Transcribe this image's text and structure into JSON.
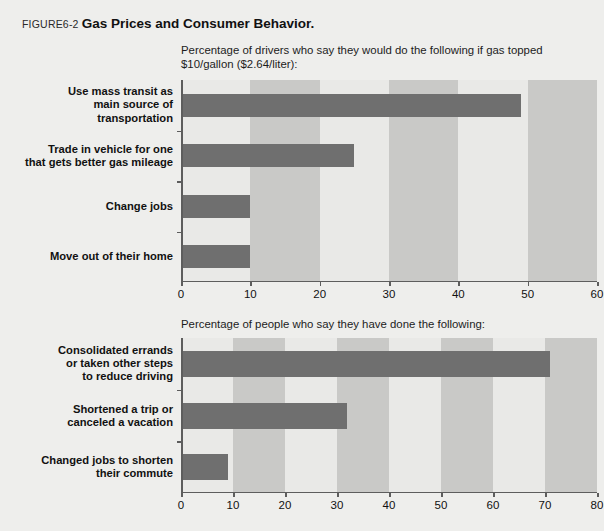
{
  "figure": {
    "number": "FIGURE6-2",
    "caption": "Gas Prices and Consumer Behavior."
  },
  "colors": {
    "background": "#eeeeec",
    "plot_background": "#e9e9e7",
    "band": "#c9c9c7",
    "bar": "#6f6f6f",
    "axis": "#5d5d5d",
    "text": "#111111"
  },
  "chart_data": [
    {
      "type": "bar",
      "orientation": "horizontal",
      "title": "Percentage of drivers who say they would do the following if gas topped $10/gallon ($2.64/liter):",
      "categories": [
        "Use mass transit as\nmain source of\ntransportation",
        "Trade in vehicle for one\nthat gets better gas mileage",
        "Change jobs",
        "Move out of their home"
      ],
      "values": [
        49,
        25,
        10,
        10
      ],
      "xlabel": "",
      "ylabel": "",
      "xlim": [
        0,
        60
      ],
      "xticks": [
        0,
        10,
        20,
        30,
        40,
        50,
        60
      ],
      "xtick_labels": [
        "0",
        "10",
        "20",
        "30",
        "40",
        "50",
        "60"
      ],
      "grid": false,
      "banded": true,
      "legend": "none"
    },
    {
      "type": "bar",
      "orientation": "horizontal",
      "title": "Percentage of people who say they have done the following:",
      "categories": [
        "Consolidated errands\nor taken other steps\nto reduce driving",
        "Shortened a trip or\ncanceled a vacation",
        "Changed jobs to shorten\ntheir commute"
      ],
      "values": [
        71,
        32,
        9
      ],
      "xlabel": "",
      "ylabel": "",
      "xlim": [
        0,
        80
      ],
      "xticks": [
        0,
        10,
        20,
        30,
        40,
        50,
        60,
        70,
        80
      ],
      "xtick_labels": [
        "0",
        "10",
        "20",
        "30",
        "40",
        "50",
        "60",
        "70",
        "80"
      ],
      "grid": false,
      "banded": true,
      "legend": "none"
    }
  ]
}
